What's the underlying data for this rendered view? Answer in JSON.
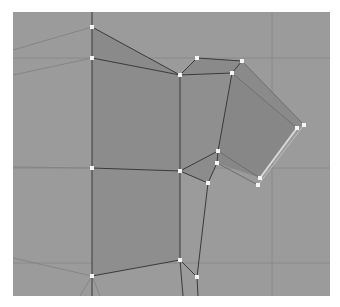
{
  "viewport": {
    "name": "3D modeling viewport - low-poly mesh wireframe",
    "background": "#9b9b9b",
    "bounds": {
      "left": 13,
      "top": 12,
      "right": 330,
      "bottom": 296
    }
  },
  "colors": {
    "face_dark": "#858585",
    "face_mid": "#8e8e8e",
    "edge": "#3a3a3a",
    "edge_light": "#b0b0b0",
    "vertex": "#f4f4f4",
    "grid": "#8a8a8a",
    "selected_edge": "#d8d8d8"
  },
  "grid_lines": {
    "horizontal": [
      58,
      168,
      263
    ],
    "vertical": [
      272
    ]
  },
  "vertices": [
    {
      "id": "A",
      "x": 92,
      "y": 27
    },
    {
      "id": "B",
      "x": 92,
      "y": 58
    },
    {
      "id": "C",
      "x": 197,
      "y": 58
    },
    {
      "id": "D",
      "x": 242,
      "y": 61
    },
    {
      "id": "E",
      "x": 180,
      "y": 75
    },
    {
      "id": "F",
      "x": 232,
      "y": 73
    },
    {
      "id": "G",
      "x": 297,
      "y": 128
    },
    {
      "id": "H",
      "x": 304,
      "y": 125
    },
    {
      "id": "I",
      "x": 218,
      "y": 151
    },
    {
      "id": "J",
      "x": 217,
      "y": 163
    },
    {
      "id": "K",
      "x": 208,
      "y": 183
    },
    {
      "id": "L",
      "x": 180,
      "y": 171
    },
    {
      "id": "M",
      "x": 92,
      "y": 168
    },
    {
      "id": "N",
      "x": 260,
      "y": 178
    },
    {
      "id": "O",
      "x": 258,
      "y": 185
    },
    {
      "id": "P",
      "x": 92,
      "y": 276
    },
    {
      "id": "Q",
      "x": 180,
      "y": 260
    },
    {
      "id": "R",
      "x": 197,
      "y": 277
    }
  ]
}
